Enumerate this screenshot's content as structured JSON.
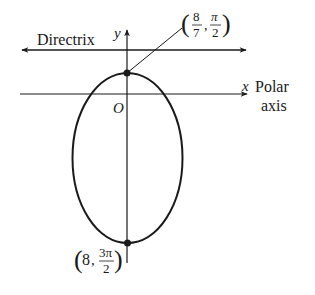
{
  "diagram": {
    "type": "polar-conic-ellipse",
    "labels": {
      "directrix": "Directrix",
      "y_axis": "y",
      "x_axis": "x",
      "polar_axis_line1": "Polar",
      "polar_axis_line2": "axis",
      "origin": "O"
    },
    "points": [
      {
        "name": "top-vertex",
        "label_r_num": "8",
        "label_r_den": "7",
        "label_theta_num": "π",
        "label_theta_den": "2"
      },
      {
        "name": "bottom-vertex",
        "label_r": "8",
        "label_theta_num": "3π",
        "label_theta_den": "2"
      }
    ],
    "colors": {
      "stroke": "#1a1a1a",
      "background": "#ffffff"
    }
  }
}
